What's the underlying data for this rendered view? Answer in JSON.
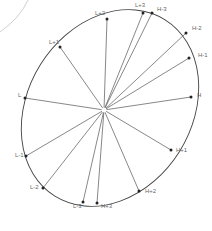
{
  "diagram": {
    "center": {
      "x": 104,
      "y": 110
    },
    "ellipse": {
      "cx": 110,
      "cy": 108,
      "rx": 82,
      "ry": 104,
      "rotate": 32
    },
    "background_arc": "M 0 32 Q 20 18 28 0",
    "colors": {
      "line": "#555555",
      "ellipse": "#444444",
      "point": "#222222",
      "label": "#666666",
      "arc": "#bbbbbb"
    },
    "points": [
      {
        "name": "L+3",
        "x": 143,
        "y": 13,
        "lx": 135,
        "ly": 7
      },
      {
        "name": "H-3",
        "x": 152,
        "y": 13,
        "lx": 157,
        "ly": 11
      },
      {
        "name": "L+2",
        "x": 107,
        "y": 19,
        "lx": 95,
        "ly": 15
      },
      {
        "name": "H-2",
        "x": 186,
        "y": 33,
        "lx": 192,
        "ly": 30
      },
      {
        "name": "L+1",
        "x": 60,
        "y": 47,
        "lx": 49,
        "ly": 44
      },
      {
        "name": "H-1",
        "x": 189,
        "y": 58,
        "lx": 198,
        "ly": 57
      },
      {
        "name": "L",
        "x": 25,
        "y": 98,
        "lx": 18,
        "ly": 97
      },
      {
        "name": "H",
        "x": 191,
        "y": 97,
        "lx": 197,
        "ly": 97
      },
      {
        "name": "L-1",
        "x": 26,
        "y": 156,
        "lx": 15,
        "ly": 157
      },
      {
        "name": "H+1",
        "x": 171,
        "y": 150,
        "lx": 176,
        "ly": 152
      },
      {
        "name": "L-2",
        "x": 43,
        "y": 188,
        "lx": 30,
        "ly": 189
      },
      {
        "name": "H+2",
        "x": 139,
        "y": 191,
        "lx": 145,
        "ly": 193
      },
      {
        "name": "L-3",
        "x": 83,
        "y": 202,
        "lx": 73,
        "ly": 208
      },
      {
        "name": "H+3",
        "x": 97,
        "y": 203,
        "lx": 101,
        "ly": 208
      }
    ]
  }
}
